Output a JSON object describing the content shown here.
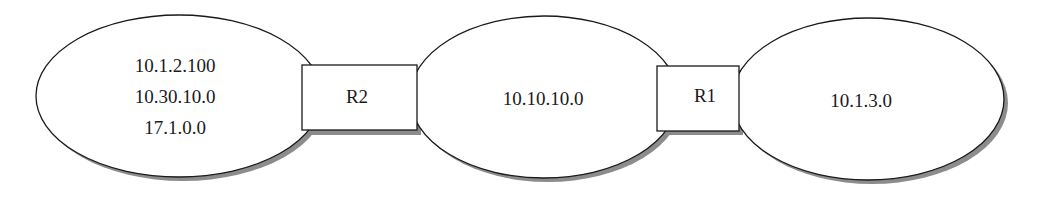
{
  "diagram": {
    "type": "network-topology",
    "networks": [
      {
        "id": "net-left",
        "labels": [
          "10.1.2.100",
          "10.30.10.0",
          "17.1.0.0"
        ]
      },
      {
        "id": "net-middle",
        "labels": [
          "10.10.10.0"
        ]
      },
      {
        "id": "net-right",
        "labels": [
          "10.1.3.0"
        ]
      }
    ],
    "routers": [
      {
        "id": "R2",
        "label": "R2",
        "connects": [
          "net-left",
          "net-middle"
        ]
      },
      {
        "id": "R1",
        "label": "R1",
        "connects": [
          "net-middle",
          "net-right"
        ]
      }
    ],
    "colors": {
      "stroke": "#1a1a1a",
      "shadow": "#8c8c8c",
      "fill": "#ffffff"
    }
  }
}
